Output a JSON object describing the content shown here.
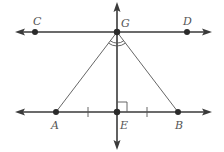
{
  "figure": {
    "type": "geometry-diagram",
    "colors": {
      "line": "#3a3a3a",
      "label": "#555555",
      "background": "#ffffff"
    },
    "points": [
      {
        "name": "C",
        "label": "C",
        "x": 35,
        "y": 32,
        "lx": 33,
        "ly": 25
      },
      {
        "name": "G",
        "label": "G",
        "x": 117,
        "y": 32,
        "lx": 121,
        "ly": 27
      },
      {
        "name": "D",
        "label": "D",
        "x": 187,
        "y": 32,
        "lx": 183,
        "ly": 25
      },
      {
        "name": "A",
        "label": "A",
        "x": 56,
        "y": 112,
        "lx": 51,
        "ly": 129
      },
      {
        "name": "E",
        "label": "E",
        "x": 117,
        "y": 112,
        "lx": 120,
        "ly": 129
      },
      {
        "name": "B",
        "label": "B",
        "x": 178,
        "y": 112,
        "lx": 175,
        "ly": 129
      }
    ],
    "lines": [
      {
        "name": "line-CD",
        "through": [
          "C",
          "G",
          "D"
        ],
        "arrows": "both"
      },
      {
        "name": "line-AB",
        "through": [
          "A",
          "E",
          "B"
        ],
        "arrows": "both"
      },
      {
        "name": "line-GE",
        "through": [
          "G",
          "E"
        ],
        "arrows": "both"
      }
    ],
    "segments": [
      {
        "name": "segment-GA",
        "from": "G",
        "to": "A"
      },
      {
        "name": "segment-GB",
        "from": "G",
        "to": "B"
      }
    ],
    "marks": {
      "right_angle_at": "E",
      "congruent_ticks": [
        "AE",
        "EB"
      ],
      "angle_arcs_at": "G",
      "angle_arc_count": 2
    }
  }
}
